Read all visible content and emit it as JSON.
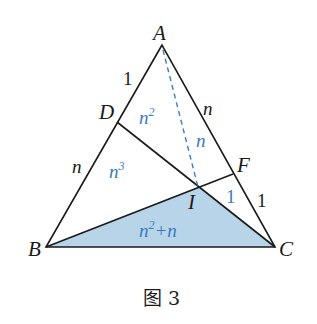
{
  "figure": {
    "caption": "图 3",
    "vertices": {
      "A": {
        "label": "A",
        "x": 162,
        "y": 45
      },
      "B": {
        "label": "B",
        "x": 46,
        "y": 247
      },
      "C": {
        "label": "C",
        "x": 275,
        "y": 247
      },
      "D": {
        "label": "D",
        "x": 117,
        "y": 122
      },
      "F": {
        "label": "F",
        "x": 233,
        "y": 174
      },
      "I": {
        "label": "I",
        "x": 198,
        "y": 187
      }
    },
    "side_labels": {
      "AD": "1",
      "DB": "n",
      "AF": "n",
      "FC": "1"
    },
    "area_labels": {
      "ADI": {
        "base": "n",
        "sup": "2"
      },
      "AIF": {
        "base": "n",
        "sup": ""
      },
      "DBI": {
        "base": "n",
        "sup": "3"
      },
      "IFC": {
        "base": "1",
        "sup": ""
      },
      "BIC": {
        "base": "n",
        "sup": "2",
        "tail": "+n"
      }
    },
    "colors": {
      "line": "#1a1a1a",
      "shade_fill": "#b8d4e8",
      "area_text": "#3a7cc0",
      "dashed": "#3a7cc0"
    }
  }
}
